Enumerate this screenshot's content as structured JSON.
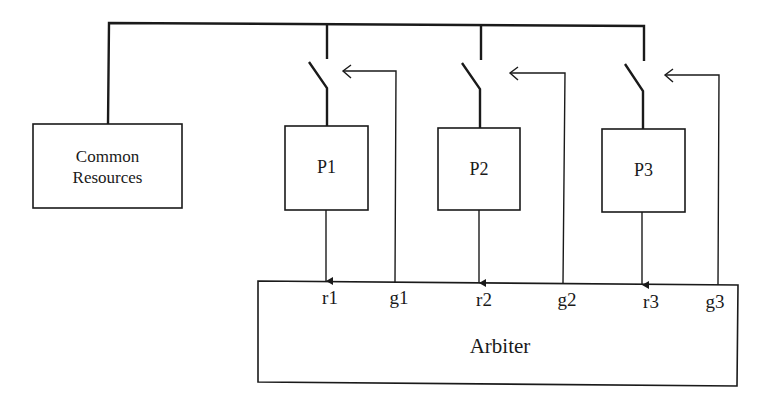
{
  "diagram": {
    "common_resources": {
      "line1": "Common",
      "line2": "Resources"
    },
    "processors": [
      {
        "label": "P1",
        "request": "r1",
        "grant": "g1"
      },
      {
        "label": "P2",
        "request": "r2",
        "grant": "g2"
      },
      {
        "label": "P3",
        "request": "r3",
        "grant": "g3"
      }
    ],
    "arbiter": {
      "label": "Arbiter"
    },
    "colors": {
      "line": "#1a1a1a",
      "background": "#ffffff"
    }
  }
}
